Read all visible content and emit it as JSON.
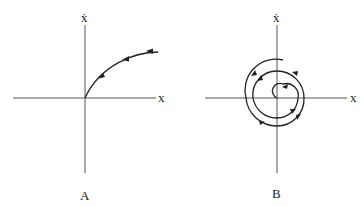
{
  "panels": [
    {
      "id": "A",
      "caption": "A",
      "x_axis_label": "x",
      "y_axis_label": "ẋ",
      "trajectory": "curve approaching origin from upper right (first quadrant)",
      "arrow_count": 3
    },
    {
      "id": "B",
      "caption": "B",
      "x_axis_label": "x",
      "y_axis_label": "ẋ",
      "trajectory": "spiral winding inward toward origin",
      "arrow_count": 7
    }
  ],
  "colors": {
    "axis": "#555555",
    "curve": "#222222",
    "background": "#ffffff"
  }
}
